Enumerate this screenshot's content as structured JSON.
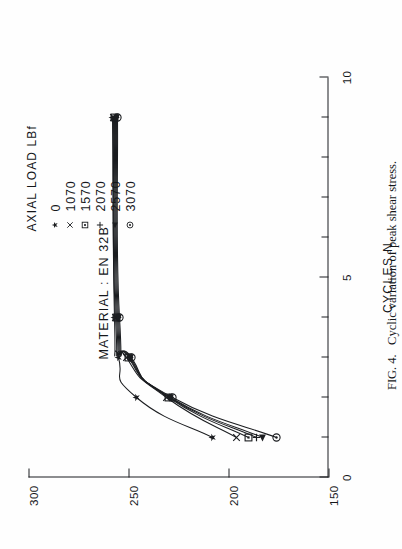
{
  "figure": {
    "caption_label": "FIG. 4.",
    "caption_text": "Cyclic variation of peak shear stress.",
    "material_note": "MATERIAL : EN 32B"
  },
  "legend": {
    "title": "AXIAL LOAD LBf",
    "entries": [
      {
        "symbol": "filled-star-marker",
        "label": "0"
      },
      {
        "symbol": "cross-marker",
        "label": "1070"
      },
      {
        "symbol": "square-marker",
        "label": "1570"
      },
      {
        "symbol": "plus-marker",
        "label": "2070"
      },
      {
        "symbol": "filled-triangle-left-marker",
        "label": "2570"
      },
      {
        "symbol": "circle-dot-marker",
        "label": "3070"
      }
    ]
  },
  "chart_data": {
    "type": "line",
    "title": "Cyclic variation of peak shear stress",
    "xlabel": "CYCLES N",
    "ylabel": "PEAK SHEAR STRESS MN m-2",
    "xlim": [
      0,
      10
    ],
    "ylim": [
      150,
      300
    ],
    "xticks": [
      0,
      5,
      10
    ],
    "xtick_labels": [
      "0",
      "5",
      "10"
    ],
    "x_minor_ticks": [
      1,
      2,
      3,
      4,
      6,
      7,
      8,
      9
    ],
    "yticks": [
      150,
      200,
      250,
      300
    ],
    "ytick_labels": [
      "150",
      "200",
      "250",
      "300"
    ],
    "grid": false,
    "legend_position": "top-right",
    "series": [
      {
        "name": "0",
        "marker": "filled-star-marker",
        "x": [
          1,
          2,
          3,
          4,
          9
        ],
        "y": [
          208,
          246,
          255,
          257,
          258
        ]
      },
      {
        "name": "1070",
        "marker": "cross-marker",
        "x": [
          1,
          2,
          3,
          4,
          9
        ],
        "y": [
          196,
          231,
          251,
          256.5,
          257.5
        ]
      },
      {
        "name": "1570",
        "marker": "square-marker",
        "x": [
          1,
          2,
          3,
          4,
          9
        ],
        "y": [
          190,
          230,
          250,
          256,
          257
        ]
      },
      {
        "name": "2070",
        "marker": "plus-marker",
        "x": [
          1,
          2,
          3,
          4,
          9
        ],
        "y": [
          186,
          229.5,
          249.5,
          255.5,
          256.5
        ]
      },
      {
        "name": "2570",
        "marker": "filled-triangle-left-marker",
        "x": [
          1,
          2,
          3,
          4,
          9
        ],
        "y": [
          183,
          229,
          249,
          255,
          256
        ]
      },
      {
        "name": "3070",
        "marker": "circle-dot-marker",
        "x": [
          1,
          2,
          3,
          4,
          9
        ],
        "y": [
          176,
          228,
          248.5,
          254.5,
          255.5
        ]
      }
    ]
  }
}
